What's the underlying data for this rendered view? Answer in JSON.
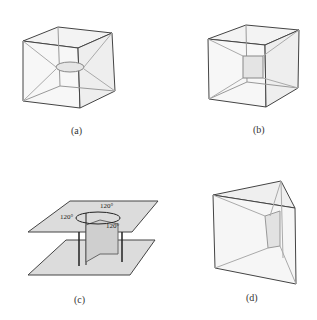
{
  "figure": {
    "panels": [
      {
        "id": "a",
        "caption": "(a)",
        "shape": "cube with inner film"
      },
      {
        "id": "b",
        "caption": "(b)",
        "shape": "cube with inner square film"
      },
      {
        "id": "c",
        "caption": "(c)",
        "shape": "parallel plates with three films meeting at 120 degrees"
      },
      {
        "id": "d",
        "caption": "(d)",
        "shape": "triangular prism with inner film"
      }
    ],
    "angle_labels": [
      "120°",
      "120°",
      "120°"
    ]
  }
}
